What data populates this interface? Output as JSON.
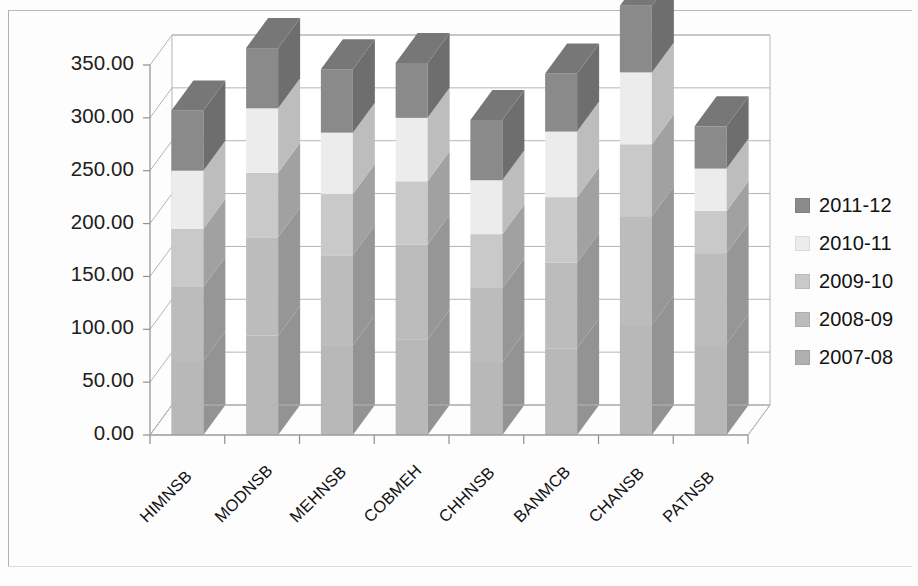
{
  "chart_data": {
    "type": "bar",
    "subtype": "stacked-column-3d",
    "title": "",
    "xlabel": "",
    "ylabel": "",
    "ylim": [
      0,
      350
    ],
    "ytick_labels": [
      "0.00",
      "50.00",
      "100.00",
      "150.00",
      "200.00",
      "250.00",
      "300.00",
      "350.00"
    ],
    "ytick_values": [
      0,
      50,
      100,
      150,
      200,
      250,
      300,
      350
    ],
    "grid": true,
    "legend_position": "right",
    "categories": [
      "HIMNSB",
      "MODNSB",
      "MEHNSB",
      "COBMEH",
      "CHHNSB",
      "BANMCB",
      "CHANSB",
      "PATNSB"
    ],
    "series": [
      {
        "name": "2007-08",
        "color": "#b8b8b8",
        "values": [
          70,
          94,
          85,
          90,
          69,
          82,
          104,
          86
        ]
      },
      {
        "name": "2008-09",
        "color": "#bcbcbc",
        "values": [
          70,
          93,
          85,
          90,
          70,
          81,
          103,
          86
        ]
      },
      {
        "name": "2009-10",
        "color": "#c9c9c9",
        "values": [
          55,
          61,
          58,
          60,
          51,
          62,
          68,
          40
        ]
      },
      {
        "name": "2010-11",
        "color": "#ececec",
        "values": [
          55,
          61,
          58,
          60,
          51,
          62,
          68,
          40
        ]
      },
      {
        "name": "2011-12",
        "color": "#8a8a8a",
        "values": [
          57,
          57,
          60,
          52,
          57,
          55,
          63,
          40
        ]
      }
    ],
    "totals": [
      252,
      305,
      288,
      292,
      247,
      280,
      338,
      252
    ],
    "stack_breakpoints": {
      "note": "cumulative tops read off gridlines",
      "HIMNSB": [
        140,
        195,
        252
      ],
      "MODNSB": [
        187,
        248,
        305
      ],
      "MEHNSB": [
        170,
        228,
        288
      ],
      "COBMEH": [
        180,
        240,
        292
      ],
      "CHHNSB": [
        139,
        190,
        247
      ],
      "BANMCB": [
        163,
        225,
        280
      ],
      "CHANSB": [
        207,
        275,
        338
      ],
      "PATNSB": [
        172,
        212,
        252
      ]
    }
  },
  "legend": {
    "items": [
      {
        "label": "2011-12",
        "color": "#8a8a8a"
      },
      {
        "label": "2010-11",
        "color": "#ececec"
      },
      {
        "label": "2009-10",
        "color": "#c9c9c9"
      },
      {
        "label": "2008-09",
        "color": "#bcbcbc"
      },
      {
        "label": "2007-08",
        "color": "#b0b0b0"
      }
    ]
  },
  "axis": {
    "y_labels": [
      "350.00",
      "300.00",
      "250.00",
      "200.00",
      "150.00",
      "100.00",
      "50.00",
      "0.00"
    ],
    "x_labels": [
      "HIMNSB",
      "MODNSB",
      "MEHNSB",
      "COBMEH",
      "CHHNSB",
      "BANMCB",
      "CHANSB",
      "PATNSB"
    ]
  },
  "colors": {
    "gridline": "#b5b5b5",
    "axis": "#8f8f8f",
    "bar_side": "#9a9a9a",
    "bar_top": "#7a7a7a",
    "background": "#ffffff",
    "frame": "#b9b9b9"
  }
}
